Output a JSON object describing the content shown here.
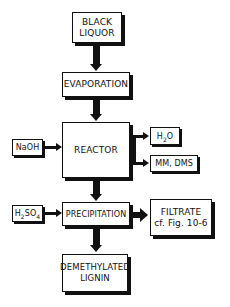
{
  "diagram": {
    "type": "process-flowchart",
    "nodes": {
      "black_liquor": {
        "line1": "BLACK",
        "line2": "LIQUOR"
      },
      "evaporation": {
        "label": "EVAPORATION"
      },
      "reactor": {
        "label": "REACTOR"
      },
      "naoh": {
        "label": "NaOH"
      },
      "h2o": {
        "prefix": "H",
        "sub": "2",
        "suffix": "O"
      },
      "mm_dms": {
        "label": "MM, DMS"
      },
      "h2so4": {
        "prefix": "H",
        "sub1": "2",
        "mid": "SO",
        "sub2": "4"
      },
      "precipitation": {
        "label": "PRECIPITATION"
      },
      "filtrate": {
        "line1": "FILTRATE",
        "line2": "cf. Fig. 10-6"
      },
      "demethylated_lignin": {
        "line1": "DEMETHYLATED",
        "line2": "LIGNIN"
      }
    },
    "edges": [
      {
        "from": "BLACK LIQUOR",
        "to": "EVAPORATION"
      },
      {
        "from": "EVAPORATION",
        "to": "REACTOR"
      },
      {
        "from": "NaOH",
        "to": "REACTOR"
      },
      {
        "from": "REACTOR",
        "to": "H2O"
      },
      {
        "from": "REACTOR",
        "to": "MM, DMS"
      },
      {
        "from": "REACTOR",
        "to": "PRECIPITATION"
      },
      {
        "from": "H2SO4",
        "to": "PRECIPITATION"
      },
      {
        "from": "PRECIPITATION",
        "to": "FILTRATE cf. Fig. 10-6"
      },
      {
        "from": "PRECIPITATION",
        "to": "DEMETHYLATED LIGNIN"
      }
    ]
  }
}
